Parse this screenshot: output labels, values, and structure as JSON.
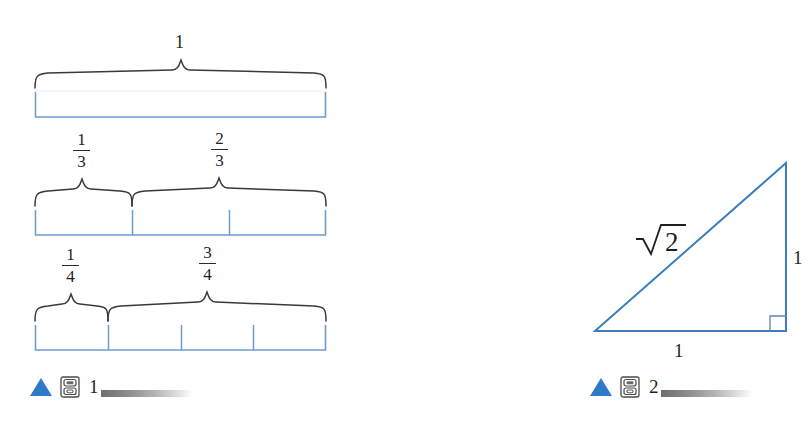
{
  "figure1": {
    "caption_number": "1",
    "marker_icon": "blue-triangle-icon",
    "cabinet_icon": "media-cabinet-icon",
    "bars": [
      {
        "name": "whole-bar",
        "segments": 1,
        "braces": [
          {
            "label": "1",
            "label_type": "whole",
            "span_from": 0,
            "span_to": 1
          }
        ]
      },
      {
        "name": "thirds-bar",
        "segments": 3,
        "braces": [
          {
            "label_numerator": "1",
            "label_denominator": "3",
            "label_type": "fraction",
            "span_from": 0,
            "span_to": 1
          },
          {
            "label_numerator": "2",
            "label_denominator": "3",
            "label_type": "fraction",
            "span_from": 1,
            "span_to": 3
          }
        ]
      },
      {
        "name": "quarters-bar",
        "segments": 4,
        "braces": [
          {
            "label_numerator": "1",
            "label_denominator": "4",
            "label_type": "fraction",
            "span_from": 0,
            "span_to": 1
          },
          {
            "label_numerator": "3",
            "label_denominator": "4",
            "label_type": "fraction",
            "span_from": 1,
            "span_to": 4
          }
        ]
      }
    ]
  },
  "figure2": {
    "caption_number": "2",
    "marker_icon": "blue-triangle-icon",
    "cabinet_icon": "media-cabinet-icon",
    "triangle": {
      "hypotenuse_label": "√2",
      "hypotenuse_radicand": "2",
      "vertical_label": "1",
      "base_label": "1",
      "right_angle_marker": true
    }
  },
  "colors": {
    "bar_stroke": "#4a7ebb",
    "brace_stroke": "#3a3a3a",
    "triangle_stroke": "#3d7ebf",
    "marker_blue": "#2e7bc6",
    "text": "#1f1f1f",
    "background": "#ffffff"
  }
}
